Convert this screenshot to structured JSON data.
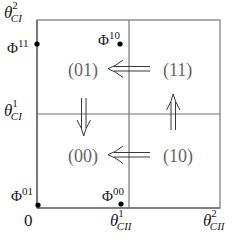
{
  "diagram": {
    "type": "state-space-partition",
    "grid": {
      "outer_box": {
        "x0": 37,
        "y0": 20,
        "x1": 220,
        "y1": 208
      },
      "mid_vertical_x": 129,
      "mid_horizontal_y": 114,
      "line_color": "#777777"
    },
    "axis_labels": {
      "origin": "0",
      "y_axis": [
        {
          "id": "theta_CI_2",
          "base": "θ",
          "sup": "2",
          "sub": "CI"
        },
        {
          "id": "theta_CI_1",
          "base": "θ",
          "sup": "1",
          "sub": "CI"
        }
      ],
      "x_axis": [
        {
          "id": "theta_CII_1",
          "base": "θ",
          "sup": "1",
          "sub": "CII"
        },
        {
          "id": "theta_CII_2",
          "base": "θ",
          "sup": "2",
          "sub": "CII"
        }
      ]
    },
    "regions": [
      {
        "id": "r01",
        "label": "(01)"
      },
      {
        "id": "r11",
        "label": "(11)"
      },
      {
        "id": "r00",
        "label": "(00)"
      },
      {
        "id": "r10",
        "label": "(10)"
      }
    ],
    "points": [
      {
        "id": "phi11",
        "base": "Φ",
        "sup": "11"
      },
      {
        "id": "phi10",
        "base": "Φ",
        "sup": "10"
      },
      {
        "id": "phi01",
        "base": "Φ",
        "sup": "01"
      },
      {
        "id": "phi00",
        "base": "Φ",
        "sup": "00"
      }
    ],
    "arrows": [
      {
        "id": "arrow-11-to-01",
        "direction": "left",
        "glyph": "⇐"
      },
      {
        "id": "arrow-10-to-00",
        "direction": "left",
        "glyph": "⇐"
      },
      {
        "id": "arrow-01-to-00",
        "direction": "down",
        "glyph": "⇓"
      },
      {
        "id": "arrow-10-to-11",
        "direction": "up",
        "glyph": "⇑"
      }
    ]
  }
}
